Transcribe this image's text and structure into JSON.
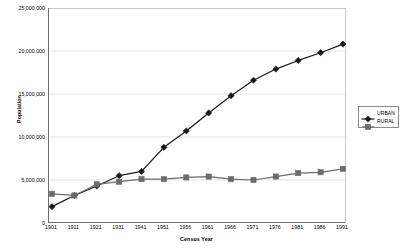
{
  "chart_data": {
    "type": "line",
    "title": "",
    "xlabel": "Census Year",
    "ylabel": "Population",
    "categories": [
      "1901",
      "1911",
      "1921",
      "1931",
      "1941",
      "1951",
      "1956",
      "1961",
      "1966",
      "1971",
      "1976",
      "1981",
      "1986",
      "1991"
    ],
    "x_tick_labels": [
      "1901",
      "1911",
      "1921",
      "1931",
      "1941",
      "1951",
      "1956",
      "1961",
      "1966",
      "1971",
      "1976",
      "1981",
      "1986",
      "1991"
    ],
    "y_tick_labels": [
      "25,000,000",
      "20,000,000",
      "15,000,000",
      "10,000,000",
      "5,000,000",
      "0"
    ],
    "y_tick_values": [
      25000000,
      20000000,
      15000000,
      10000000,
      5000000,
      0
    ],
    "ylim": [
      0,
      25000000
    ],
    "grid": true,
    "grid_axis": "y",
    "legend_position": "right",
    "series": [
      {
        "name": "URBAN",
        "marker": "diamond",
        "color": "#1a1a1a",
        "values": [
          1900000,
          3200000,
          4300000,
          5500000,
          6000000,
          8800000,
          10700000,
          12800000,
          14800000,
          16600000,
          17900000,
          18900000,
          19800000,
          20800000
        ]
      },
      {
        "name": "RURAL",
        "marker": "square",
        "color": "#6b6b6b",
        "values": [
          3400000,
          3200000,
          4500000,
          4800000,
          5100000,
          5100000,
          5300000,
          5400000,
          5100000,
          5000000,
          5400000,
          5800000,
          5900000,
          6300000
        ]
      }
    ]
  },
  "legend": {
    "items": [
      {
        "label": "URBAN"
      },
      {
        "label": "RURAL"
      }
    ]
  }
}
